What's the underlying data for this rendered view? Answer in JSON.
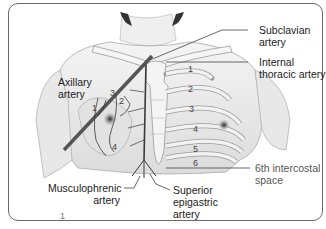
{
  "figure_number": "1",
  "labels": {
    "subclavian": [
      "Subclavian",
      "artery"
    ],
    "internal_thoracic": [
      "Internal",
      "thoracic artery"
    ],
    "axillary": [
      "Axillary",
      "artery"
    ],
    "intercostal": [
      "6th intercostal",
      "space"
    ],
    "musculophrenic": [
      "Musculophrenic",
      "artery"
    ],
    "superior_epigastric": [
      "Superior",
      "epigastric",
      "artery"
    ]
  },
  "rib_numbers_right": [
    "1",
    "2",
    "3",
    "4",
    "5",
    "6"
  ],
  "branch_numbers_left": [
    "1",
    "2",
    "3",
    "4"
  ],
  "colors": {
    "frame": "#6a6a6a",
    "artery": "#3a3a3a",
    "body_fill": "#e6e6e6",
    "rib_fill": "#f2f2f2",
    "text": "#222222"
  }
}
